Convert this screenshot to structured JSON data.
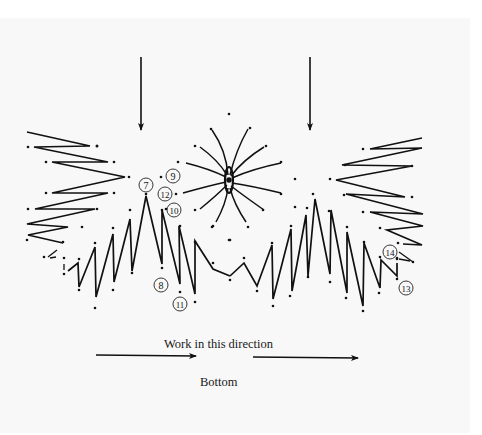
{
  "diagram": {
    "type": "stitch pattern diagram",
    "captions": {
      "direction": "Work in this direction",
      "bottom": "Bottom"
    },
    "number_labels": [
      {
        "text": "7",
        "x": 146,
        "y": 185
      },
      {
        "text": "9",
        "x": 173,
        "y": 176
      },
      {
        "text": "12",
        "x": 165,
        "y": 194
      },
      {
        "text": "10",
        "x": 174,
        "y": 210
      },
      {
        "text": "8",
        "x": 161,
        "y": 285
      },
      {
        "text": "11",
        "x": 180,
        "y": 304
      },
      {
        "text": "14",
        "x": 390,
        "y": 252
      },
      {
        "text": "13",
        "x": 406,
        "y": 288
      }
    ],
    "arrows": [
      {
        "name": "down-arrow-left",
        "x1": 141,
        "y1": 57,
        "x2": 141,
        "y2": 131
      },
      {
        "name": "down-arrow-right",
        "x1": 310,
        "y1": 57,
        "x2": 310,
        "y2": 131
      },
      {
        "name": "right-arrow-left",
        "x1": 96,
        "y1": 355,
        "x2": 196,
        "y2": 356
      },
      {
        "name": "right-arrow-right",
        "x1": 253,
        "y1": 357,
        "x2": 358,
        "y2": 358
      }
    ],
    "colors": {
      "ink": "#111111",
      "page": "#f8f8f8"
    }
  }
}
